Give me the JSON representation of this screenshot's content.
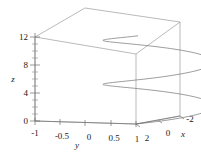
{
  "figure": {
    "kind": "3d-parametric-curve-plot",
    "background_color": "#ffffff",
    "line_color": "#7a7a7a",
    "box_color": "#8c8c8c",
    "axis_color": "#6e6e6e",
    "text_color": "#1a1a1a"
  },
  "chart_data": {
    "type": "line",
    "title": "",
    "subtitle": "",
    "projection": "3d",
    "xlabel": "x",
    "ylabel": "y",
    "zlabel": "z",
    "xlim": [
      -2,
      2
    ],
    "ylim": [
      -1,
      1
    ],
    "zlim": [
      0,
      13
    ],
    "grid": false,
    "legend": null,
    "legend_position": "none",
    "box": true,
    "x_ticks": [
      2,
      0,
      -2
    ],
    "x_tick_labels": [
      "2",
      "0",
      "-2"
    ],
    "y_ticks": [
      -1,
      -0.5,
      0,
      0.5,
      1
    ],
    "y_tick_labels": [
      "-1",
      "-0.5",
      "0",
      "0.5",
      "1"
    ],
    "z_ticks": [
      0,
      4,
      8,
      12
    ],
    "z_tick_labels": [
      "0",
      "4",
      "8",
      "12"
    ],
    "z_minor_ticks": [
      1,
      2,
      3,
      5,
      6,
      7,
      9,
      10,
      11
    ],
    "series": [
      {
        "name": "helix",
        "parametric": true,
        "t_range": [
          0,
          12.6
        ],
        "x_expr": "2*cos(t)",
        "y_expr": "sin(t)",
        "z_expr": "t",
        "turns": 2,
        "samples": 240
      }
    ],
    "annotations": []
  },
  "labels": {
    "x_axis_title": "x",
    "y_axis_title": "y",
    "z_axis_title": "z",
    "x0": "2",
    "x1": "0",
    "x2": "-2",
    "y0": "-1",
    "y1": "-0.5",
    "y2": "0",
    "y3": "0.5",
    "y4": "1",
    "z0": "0",
    "z1": "4",
    "z2": "8",
    "z3": "12"
  }
}
